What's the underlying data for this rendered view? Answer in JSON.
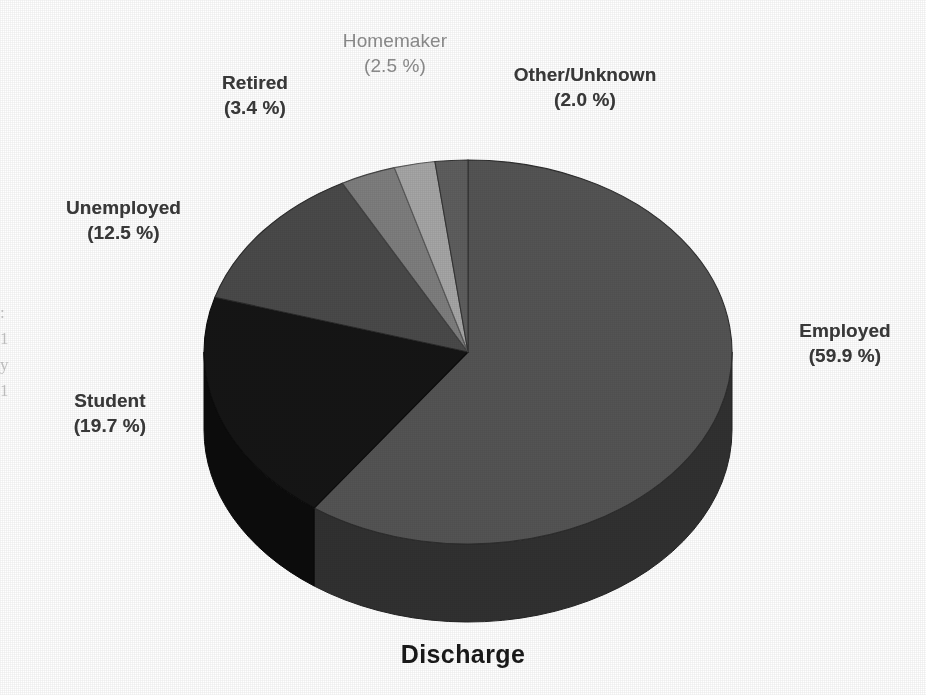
{
  "chart_data": {
    "type": "pie",
    "title": "Discharge",
    "xlabel": "",
    "ylabel": "",
    "three_d": true,
    "legend_position": "callout-labels",
    "grid": false,
    "start_angle_deg": 0,
    "direction": "clockwise",
    "categories": [
      "Employed",
      "Student",
      "Unemployed",
      "Retired",
      "Homemaker",
      "Other/Unknown"
    ],
    "values": [
      59.9,
      19.7,
      12.5,
      3.4,
      2.5,
      2.0
    ],
    "value_unit": "%",
    "slices": [
      {
        "label": "Employed",
        "percent": 59.9,
        "percent_text": "(59.9 %)",
        "color": "#545454"
      },
      {
        "label": "Student",
        "percent": 19.7,
        "percent_text": "(19.7 %)",
        "color": "#151515"
      },
      {
        "label": "Unemployed",
        "percent": 12.5,
        "percent_text": "(12.5 %)",
        "color": "#4a4a4a"
      },
      {
        "label": "Retired",
        "percent": 3.4,
        "percent_text": "(3.4 %)",
        "color": "#7e7e7e"
      },
      {
        "label": "Homemaker",
        "percent": 2.5,
        "percent_text": "(2.5 %)",
        "color": "#a6a6a6"
      },
      {
        "label": "Other/Unknown",
        "percent": 2.0,
        "percent_text": "(2.0 %)",
        "color": "#5e5e5e"
      }
    ]
  },
  "labels": {
    "retired": {
      "name": "Retired",
      "pct": "(3.4 %)"
    },
    "homemaker": {
      "name": "Homemaker",
      "pct": "(2.5 %)"
    },
    "other": {
      "name": "Other/Unknown",
      "pct": "(2.0 %)"
    },
    "unemployed": {
      "name": "Unemployed",
      "pct": "(12.5 %)"
    },
    "student": {
      "name": "Student",
      "pct": "(19.7 %)"
    },
    "employed": {
      "name": "Employed",
      "pct": "(59.9 %)"
    }
  },
  "title": {
    "text": "Discharge"
  },
  "page_bleed": {
    "line1": ":",
    "line2": "1",
    "line3": "y",
    "line4": "1"
  },
  "colors": {
    "background": "#ffffff",
    "label_text": "#3a3a3a",
    "label_text_faint": "#8d8d8d",
    "title_text": "#1a1a1a",
    "employed": "#545454",
    "student": "#151515",
    "unemployed": "#4a4a4a",
    "retired": "#7e7e7e",
    "homemaker": "#a6a6a6",
    "other_unknown": "#5e5e5e"
  }
}
